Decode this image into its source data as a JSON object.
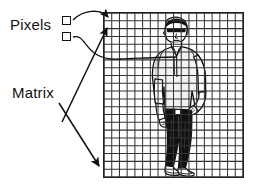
{
  "figure": {
    "type": "diagram",
    "background_color": "#ffffff",
    "ink_color": "#111111"
  },
  "labels": {
    "pixels": "Pixels",
    "matrix": "Matrix"
  },
  "pixel_squares": [
    {
      "name": "pixel-square-top",
      "x": 62,
      "y": 16,
      "size": 9
    },
    {
      "name": "pixel-square-bottom",
      "x": 62,
      "y": 32,
      "size": 9
    }
  ],
  "grid": {
    "name": "matrix-grid",
    "x": 103,
    "y": 12,
    "width": 141,
    "height": 166,
    "columns": 18,
    "rows": 21,
    "cell_width": 7.83,
    "cell_height": 7.9,
    "line_color": "#333333",
    "border_color": "#222222",
    "fill_color": "#ffffff"
  },
  "arrows": [
    {
      "name": "pixels-to-grid-corner-arrow",
      "description": "curved arrow from upper pixel square to top-left corner of grid",
      "from": [
        74,
        20
      ],
      "to": [
        110,
        17
      ],
      "style": "curved"
    },
    {
      "name": "pixels-to-grid-interior-arrow",
      "description": "long curve from lower pixel square sweeping right into the grid near the figure",
      "from": [
        74,
        37
      ],
      "to": [
        176,
        58
      ],
      "style": "curved"
    },
    {
      "name": "matrix-to-grid-top-arrow",
      "description": "straight arrow from Matrix label up-right toward grid upper-left area",
      "from": [
        62,
        122
      ],
      "to": [
        108,
        27
      ],
      "style": "straight"
    },
    {
      "name": "matrix-to-grid-bottom-arrow",
      "description": "straight arrow from Matrix label down-right toward grid lower-left corner",
      "from": [
        60,
        103
      ],
      "to": [
        100,
        165
      ],
      "style": "straight"
    }
  ],
  "person": {
    "name": "standing-person-illustration",
    "description": "line-art drawing of a man standing, hands on hips, wearing sunglasses, light shirt, dark trousers and white shoes, overlaid by the matrix grid",
    "shirt_color": "#f2f2f2",
    "trousers_color": "#111111",
    "shoes_color": "#ffffff",
    "outline_color": "#111111"
  }
}
